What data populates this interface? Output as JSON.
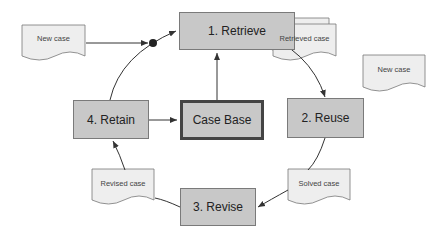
{
  "nodes": {
    "retrieve": "1. Retrieve",
    "reuse": "2. Reuse",
    "revise": "3. Revise",
    "retain": "4. Retain",
    "case_base": "Case Base"
  },
  "documents": {
    "new_case_input": "New case",
    "retrieved_case": "Retrieved case",
    "new_case_copy": "New case",
    "solved_case": "Solved case",
    "revised_case": "Revised case"
  },
  "colors": {
    "box_fill": "#c8c8c8",
    "doc_fill": "#eeeeee",
    "line": "#444444"
  }
}
